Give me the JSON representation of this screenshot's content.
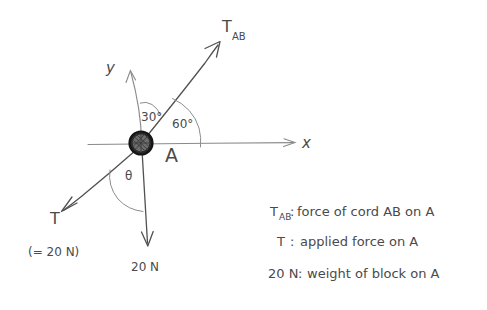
{
  "figure": {
    "type": "free-body-diagram",
    "background_color": "#ffffff",
    "ink_color": "#4a4a4a",
    "axis_color": "#8a8a8a",
    "particle_color": "#2a2a2a"
  },
  "axes": {
    "x_label": "x",
    "y_label": "y",
    "origin": {
      "x": 141,
      "y": 143
    }
  },
  "particle": {
    "label": "A",
    "description": "block-at-origin"
  },
  "angles": [
    {
      "name": "angle-30",
      "value": "30°",
      "between": "y-axis and T_AB"
    },
    {
      "name": "angle-60",
      "value": "60°",
      "between": "T_AB and x-axis"
    },
    {
      "name": "angle-theta",
      "value": "θ",
      "between": "T and downward 20 N"
    }
  ],
  "vectors": [
    {
      "name": "T_AB",
      "label_main": "T",
      "label_sub": "AB",
      "direction": "up-right at 60 degrees above x-axis"
    },
    {
      "name": "T",
      "label_main": "T",
      "label_sub": "",
      "note": "(= 20 N)",
      "direction": "down-left"
    },
    {
      "name": "weight",
      "label_main": "20 N",
      "label_sub": "",
      "direction": "straight down"
    }
  ],
  "legend": {
    "lines": [
      {
        "symbol_main": "T",
        "symbol_sub": "AB",
        "separator": ":",
        "text": "force of cord AB on A"
      },
      {
        "symbol_main": "T",
        "symbol_sub": "",
        "separator": ":",
        "text": "applied force  on A"
      },
      {
        "symbol_main": "20 N",
        "symbol_sub": "",
        "separator": ":",
        "text": "weight of block on A"
      }
    ]
  }
}
